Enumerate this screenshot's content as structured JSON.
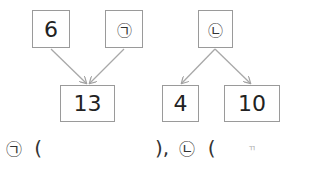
{
  "diagram_left": {
    "top_left": "6",
    "top_right": "㉠",
    "bottom": "13",
    "relation": "top boxes combine into bottom box"
  },
  "diagram_right": {
    "top": "㉡",
    "bottom_left": "4",
    "bottom_right": "10",
    "relation": "top box splits into bottom boxes"
  },
  "answer_line": {
    "label_1": "㉠",
    "open_1": "(",
    "close_1": "),",
    "label_2": "㉡",
    "open_2": "(",
    "close_2": ")",
    "stray_mark": "ㄲ"
  },
  "colors": {
    "box_border": "#9a9a9a",
    "arrow": "#a0a0a0",
    "text": "#222222"
  }
}
